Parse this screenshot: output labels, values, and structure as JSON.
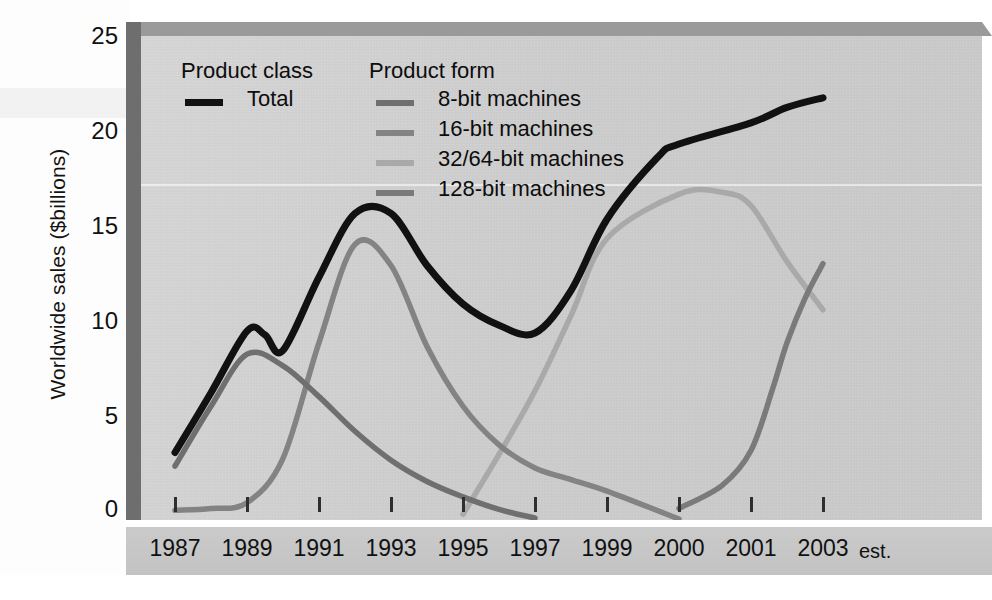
{
  "chart_data": {
    "type": "line",
    "title": "",
    "xlabel": "",
    "ylabel": "Worldwide sales ($billions)",
    "ylim": [
      0,
      25
    ],
    "yticks": [
      0,
      5,
      10,
      15,
      20,
      25
    ],
    "grid": false,
    "legend_position": "top-left-inside",
    "x_tick_labels": [
      "1987",
      "1989",
      "1991",
      "1993",
      "1995",
      "1997",
      "1999",
      "2000",
      "2001",
      "2003"
    ],
    "x_axis_suffix": "est.",
    "legend_groups": [
      {
        "title": "Product class",
        "entries": [
          {
            "label": "Total",
            "color": "#111111"
          }
        ]
      },
      {
        "title": "Product form",
        "entries": [
          {
            "label": "8-bit machines",
            "color": "#6f6f6f"
          },
          {
            "label": "16-bit machines",
            "color": "#838383"
          },
          {
            "label": "32/64-bit machines",
            "color": "#a9a9a9"
          },
          {
            "label": "128-bit machines",
            "color": "#7a7a7a"
          }
        ]
      }
    ],
    "series": [
      {
        "name": "Total",
        "color": "#111111",
        "points": [
          [
            1987,
            3.5
          ],
          [
            1988,
            6.6
          ],
          [
            1989,
            9.8
          ],
          [
            1989.5,
            9.6
          ],
          [
            1990,
            8.8
          ],
          [
            1991,
            12.6
          ],
          [
            1992,
            15.9
          ],
          [
            1993,
            15.9
          ],
          [
            1994,
            13.2
          ],
          [
            1995,
            11.2
          ],
          [
            1996,
            10.1
          ],
          [
            1997,
            9.7
          ],
          [
            1998,
            11.9
          ],
          [
            1999,
            15.6
          ],
          [
            1999.7,
            18.8
          ],
          [
            2000,
            19.5
          ],
          [
            2001,
            20.6
          ],
          [
            2002,
            21.4
          ],
          [
            2003,
            21.9
          ]
        ]
      },
      {
        "name": "8-bit machines",
        "color": "#6f6f6f",
        "points": [
          [
            1987,
            2.8
          ],
          [
            1988,
            5.9
          ],
          [
            1989,
            8.6
          ],
          [
            1990,
            8.0
          ],
          [
            1991,
            6.4
          ],
          [
            1992,
            4.6
          ],
          [
            1993,
            3.1
          ],
          [
            1994,
            2.0
          ],
          [
            1995,
            1.2
          ],
          [
            1996,
            0.55
          ],
          [
            1997,
            0.1
          ]
        ]
      },
      {
        "name": "16-bit machines",
        "color": "#838383",
        "points": [
          [
            1987,
            0.5
          ],
          [
            1988,
            0.6
          ],
          [
            1989,
            0.9
          ],
          [
            1990,
            3.2
          ],
          [
            1991,
            9.2
          ],
          [
            1992,
            14.3
          ],
          [
            1993,
            13.2
          ],
          [
            1994,
            9.0
          ],
          [
            1995,
            5.9
          ],
          [
            1996,
            3.9
          ],
          [
            1997,
            2.7
          ],
          [
            1998,
            2.1
          ],
          [
            1999,
            1.5
          ],
          [
            2000,
            0.05
          ]
        ]
      },
      {
        "name": "32/64-bit machines",
        "color": "#a9a9a9",
        "points": [
          [
            1995,
            0.3
          ],
          [
            1996,
            3.4
          ],
          [
            1997,
            6.7
          ],
          [
            1998,
            10.6
          ],
          [
            1999,
            14.6
          ],
          [
            2000,
            16.9
          ],
          [
            2000.6,
            17.0
          ],
          [
            2001,
            16.3
          ],
          [
            2002,
            13.4
          ],
          [
            2003,
            10.9
          ]
        ]
      },
      {
        "name": "128-bit machines",
        "color": "#7a7a7a",
        "points": [
          [
            2000,
            0.6
          ],
          [
            2000.6,
            1.8
          ],
          [
            2001,
            3.6
          ],
          [
            2001.6,
            6.8
          ],
          [
            2002,
            9.2
          ],
          [
            2002.5,
            11.5
          ],
          [
            2003,
            13.3
          ]
        ]
      }
    ]
  },
  "axis": {
    "y_title": "Worldwide sales ($billions)",
    "y_labels": [
      "25",
      "20",
      "15",
      "10",
      "5",
      "0"
    ],
    "x_labels": [
      "1987",
      "1989",
      "1991",
      "1993",
      "1995",
      "1997",
      "1999",
      "2000",
      "2001",
      "2003"
    ],
    "x_estimate_note": "est."
  },
  "legend": {
    "class_title": "Product class",
    "form_title": "Product form",
    "total_label": "Total",
    "form_labels": [
      "8-bit machines",
      "16-bit machines",
      "32/64-bit machines",
      "128-bit machines"
    ]
  },
  "colors": {
    "total": "#111111",
    "bit8": "#6f6f6f",
    "bit16": "#838383",
    "bit3264": "#a9a9a9",
    "bit128": "#7a7a7a",
    "plot_bg": "#cfcfcf",
    "band_bg": "#c6c6c6",
    "bevel_left": "#6e6e6e",
    "bevel_top": "#9a9a9a"
  }
}
